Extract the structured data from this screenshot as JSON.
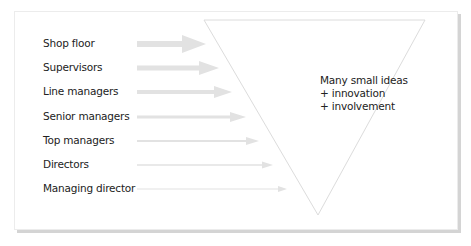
{
  "diagram": {
    "levels": [
      {
        "label": "Shop floor",
        "y": 44,
        "tip_x": 206,
        "head_h": 18,
        "head_w": 24,
        "tail_h": 6
      },
      {
        "label": "Supervisors",
        "y": 68,
        "tip_x": 219,
        "head_h": 14,
        "head_w": 20,
        "tail_h": 5
      },
      {
        "label": "Line managers",
        "y": 92,
        "tip_x": 232,
        "head_h": 12,
        "head_w": 18,
        "tail_h": 4
      },
      {
        "label": "Senior managers",
        "y": 117,
        "tip_x": 246,
        "head_h": 10,
        "head_w": 16,
        "tail_h": 3
      },
      {
        "label": "Top managers",
        "y": 141,
        "tip_x": 259,
        "head_h": 8,
        "head_w": 13,
        "tail_h": 2
      },
      {
        "label": "Directors",
        "y": 165,
        "tip_x": 273,
        "head_h": 7,
        "head_w": 11,
        "tail_h": 1.5
      },
      {
        "label": "Managing director",
        "y": 189,
        "tip_x": 287,
        "head_h": 6,
        "head_w": 9,
        "tail_h": 1
      }
    ],
    "arrow_start_x": 137,
    "arrow_color": "#e2e2e2",
    "triangle": {
      "points": "204,20 425,20 318,215",
      "stroke": "#dcdcdc"
    },
    "center_text": {
      "line1": "Many small ideas",
      "line2": "+ innovation",
      "line3": "+ involvement"
    }
  }
}
